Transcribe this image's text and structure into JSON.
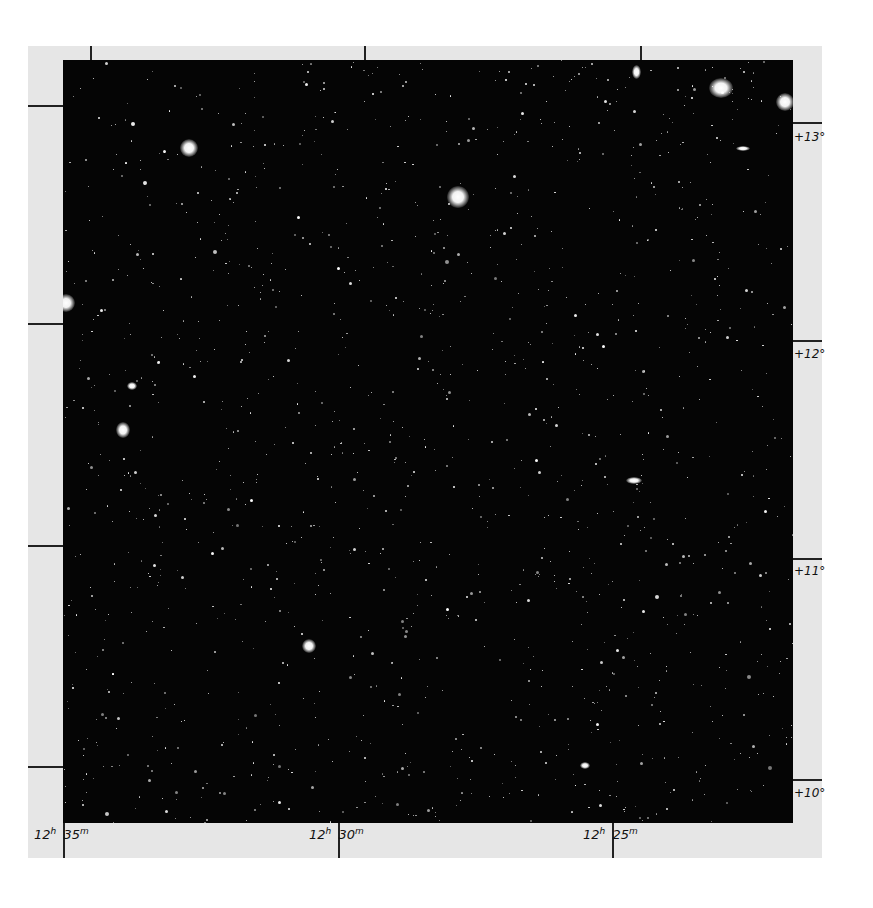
{
  "figure": {
    "colors": {
      "page_background": "#ffffff",
      "mat": "#e6e6e6",
      "sky": "#050505",
      "stars": "#ffffff",
      "tick_lines": "#222222",
      "label_text": "#111111"
    },
    "right_ascension_labels": [
      {
        "hours": "12",
        "hours_unit": "h",
        "minutes": "35",
        "minutes_unit": "m",
        "x": 63
      },
      {
        "hours": "12",
        "hours_unit": "h",
        "minutes": "30",
        "minutes_unit": "m",
        "x": 338
      },
      {
        "hours": "12",
        "hours_unit": "h",
        "minutes": "25",
        "minutes_unit": "m",
        "x": 612
      }
    ],
    "declination_labels": [
      {
        "text": "+13°",
        "y": 123
      },
      {
        "text": "+12°",
        "y": 341
      },
      {
        "text": "+11°",
        "y": 558
      },
      {
        "text": "+10°",
        "y": 780
      }
    ]
  }
}
